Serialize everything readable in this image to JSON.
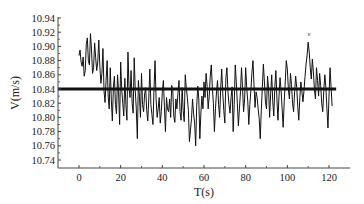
{
  "chart_data": {
    "type": "line",
    "title": "",
    "xlabel": "T(s)",
    "ylabel": "V(m/s)",
    "xlim": [
      -10,
      130
    ],
    "ylim": [
      10.729,
      10.942
    ],
    "xticks": [
      0,
      20,
      40,
      60,
      80,
      100,
      120
    ],
    "xtick_labels": [
      "0",
      "20",
      "40",
      "60",
      "80",
      "100",
      "120"
    ],
    "yticks": [
      10.74,
      10.76,
      10.78,
      10.8,
      10.82,
      10.84,
      10.86,
      10.88,
      10.9,
      10.92,
      10.94
    ],
    "ytick_labels": [
      "10.74",
      "10.76",
      "10.78",
      "10.80",
      "10.82",
      "10.84",
      "10.86",
      "10.88",
      "10.90",
      "10.92",
      "10.94"
    ],
    "grid": false,
    "legend": null,
    "series": [
      {
        "name": "Velocity",
        "color": "#111111",
        "x_start": 0,
        "x_step": 0.5,
        "values": [
          10.887,
          10.895,
          10.878,
          10.872,
          10.885,
          10.858,
          10.866,
          10.903,
          10.912,
          10.88,
          10.874,
          10.918,
          10.895,
          10.862,
          10.87,
          10.905,
          10.884,
          10.866,
          10.878,
          10.909,
          10.872,
          10.848,
          10.862,
          10.897,
          10.838,
          10.821,
          10.852,
          10.88,
          10.83,
          10.812,
          10.87,
          10.826,
          10.795,
          10.842,
          10.858,
          10.818,
          10.805,
          10.86,
          10.836,
          10.79,
          10.878,
          10.84,
          10.82,
          10.802,
          10.855,
          10.818,
          10.796,
          10.892,
          10.842,
          10.828,
          10.866,
          10.82,
          10.806,
          10.884,
          10.838,
          10.812,
          10.77,
          10.852,
          10.83,
          10.8,
          10.862,
          10.818,
          10.808,
          10.833,
          10.842,
          10.81,
          10.795,
          10.826,
          10.868,
          10.818,
          10.804,
          10.79,
          10.84,
          10.88,
          10.826,
          10.8,
          10.812,
          10.828,
          10.792,
          10.808,
          10.836,
          10.852,
          10.815,
          10.78,
          10.828,
          10.812,
          10.808,
          10.826,
          10.8,
          10.845,
          10.838,
          10.802,
          10.793,
          10.826,
          10.812,
          10.834,
          10.852,
          10.808,
          10.796,
          10.842,
          10.81,
          10.794,
          10.86,
          10.842,
          10.828,
          10.81,
          10.766,
          10.782,
          10.798,
          10.826,
          10.805,
          10.792,
          10.76,
          10.816,
          10.844,
          10.826,
          10.77,
          10.806,
          10.83,
          10.812,
          10.85,
          10.828,
          10.862,
          10.844,
          10.812,
          10.83,
          10.858,
          10.874,
          10.843,
          10.82,
          10.78,
          10.812,
          10.836,
          10.852,
          10.818,
          10.8,
          10.84,
          10.868,
          10.834,
          10.81,
          10.792,
          10.856,
          10.87,
          10.836,
          10.818,
          10.806,
          10.828,
          10.843,
          10.78,
          10.818,
          10.874,
          10.85,
          10.82,
          10.788,
          10.812,
          10.836,
          10.87,
          10.842,
          10.808,
          10.826,
          10.87,
          10.842,
          10.823,
          10.79,
          10.818,
          10.838,
          10.862,
          10.88,
          10.846,
          10.814,
          10.836,
          10.828,
          10.812,
          10.798,
          10.77,
          10.81,
          10.842,
          10.875,
          10.85,
          10.822,
          10.812,
          10.858,
          10.84,
          10.8,
          10.834,
          10.86,
          10.822,
          10.802,
          10.843,
          10.866,
          10.826,
          10.796,
          10.83,
          10.856,
          10.838,
          10.812,
          10.786,
          10.822,
          10.85,
          10.88,
          10.868,
          10.84,
          10.826,
          10.862,
          10.846,
          10.82,
          10.808,
          10.836,
          10.858,
          10.842,
          10.815,
          10.796,
          10.828,
          10.85,
          10.836,
          10.822,
          10.838,
          10.858,
          10.875,
          10.888,
          10.906,
          10.892,
          10.87,
          10.854,
          10.882,
          10.864,
          10.84,
          10.826,
          10.87,
          10.852,
          10.83,
          10.862,
          10.845,
          10.82,
          10.808,
          10.838,
          10.86,
          10.842,
          10.812,
          10.785,
          10.83,
          10.87,
          10.842,
          10.816
        ]
      }
    ],
    "reference_line": {
      "label": "mean",
      "value": 10.84,
      "x_range": [
        -10,
        122
      ],
      "color": "#111111",
      "width": 3
    },
    "annotations": [
      {
        "text": "ε",
        "x": 110,
        "y": 10.913
      }
    ]
  }
}
